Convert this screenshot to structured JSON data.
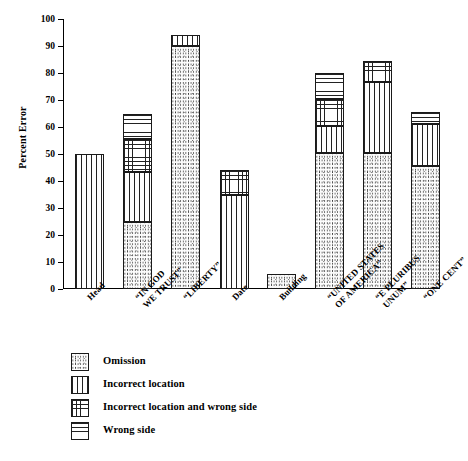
{
  "chart_data": {
    "type": "bar",
    "title": "",
    "subtitle": "",
    "xlabel": "",
    "ylabel": "Percent Error",
    "ylim": [
      0,
      100
    ],
    "yticks": [
      0,
      10,
      20,
      30,
      40,
      50,
      60,
      70,
      80,
      90,
      100
    ],
    "grid": false,
    "stacked": true,
    "legend_position": "below-plot",
    "categories": [
      "Head",
      "“IN GOD\nWE TRUST”",
      "“LIBERTY”",
      "Date",
      "Building",
      "“UNITED STATES\nOF AMERICA”",
      "“E PLURIBUS\nUNUM”",
      "“ONE CENT”"
    ],
    "series": [
      {
        "name": "Omission",
        "pattern": "stipple",
        "values": [
          0,
          25,
          90,
          0,
          5.5,
          50.5,
          50.5,
          45.5
        ]
      },
      {
        "name": "Incorrect location",
        "pattern": "vertical",
        "values": [
          50,
          18.5,
          4,
          35,
          0,
          10,
          26,
          15.5
        ]
      },
      {
        "name": "Incorrect location and wrong side",
        "pattern": "grid",
        "values": [
          0,
          12,
          0,
          9,
          0,
          10,
          8,
          0
        ]
      },
      {
        "name": "Wrong side",
        "pattern": "horizontal",
        "values": [
          0,
          9.5,
          0,
          0,
          0,
          9.5,
          0,
          4.5
        ]
      }
    ],
    "totals": [
      50,
      65,
      94,
      44,
      5.5,
      80,
      84.5,
      65.5
    ]
  },
  "axis": {
    "y_tick_labels": [
      "0",
      "10",
      "20",
      "30",
      "40",
      "50",
      "60",
      "70",
      "80",
      "90",
      "100"
    ],
    "y_title": "Percent Error"
  },
  "x_labels": [
    {
      "line1": "Head",
      "line2": ""
    },
    {
      "line1": "“IN GOD",
      "line2": "WE TRUST”"
    },
    {
      "line1": "“LIBERTY”",
      "line2": ""
    },
    {
      "line1": "Date",
      "line2": ""
    },
    {
      "line1": "Building",
      "line2": ""
    },
    {
      "line1": "“UNITED STATES",
      "line2": "OF AMERICA”"
    },
    {
      "line1": "“E PLURIBUS",
      "line2": "UNUM”"
    },
    {
      "line1": "“ONE CENT”",
      "line2": ""
    }
  ],
  "legend": {
    "items": [
      {
        "label": "Omission",
        "pattern": "stipple"
      },
      {
        "label": "Incorrect location",
        "pattern": "vertical"
      },
      {
        "label": "Incorrect location and wrong side",
        "pattern": "grid"
      },
      {
        "label": "Wrong side",
        "pattern": "horizontal"
      }
    ]
  },
  "colors": {
    "ink": "#000000",
    "background": "#ffffff",
    "hatch": "#222222"
  }
}
